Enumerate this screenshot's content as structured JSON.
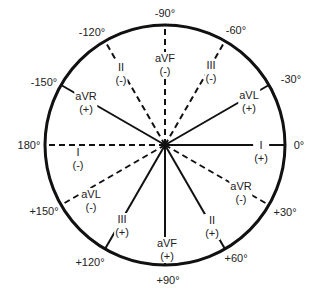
{
  "diagram": {
    "center": [
      165,
      145
    ],
    "radius": 120,
    "colors": {
      "line": "#111111",
      "background": "#ffffff"
    },
    "angle_labels": [
      {
        "text": "-90°",
        "x": 165,
        "y": 13
      },
      {
        "text": "-60°",
        "x": 236,
        "y": 30
      },
      {
        "text": "-30°",
        "x": 291,
        "y": 79
      },
      {
        "text": "0°",
        "x": 299,
        "y": 145
      },
      {
        "text": "+30°",
        "x": 285,
        "y": 212
      },
      {
        "text": "+60°",
        "x": 236,
        "y": 258
      },
      {
        "text": "+90°",
        "x": 168,
        "y": 280
      },
      {
        "text": "+120°",
        "x": 90,
        "y": 262
      },
      {
        "text": "+150°",
        "x": 44,
        "y": 211
      },
      {
        "text": "180°",
        "x": 29,
        "y": 145
      },
      {
        "text": "-150°",
        "x": 44,
        "y": 82
      },
      {
        "text": "-120°",
        "x": 92,
        "y": 32
      }
    ],
    "leads": [
      {
        "name": "aVF",
        "sign": "(-)",
        "angle": -90,
        "style": "dashed",
        "x": 165,
        "y": 65
      },
      {
        "name": "III",
        "sign": "(-)",
        "angle": -60,
        "style": "dashed",
        "x": 211,
        "y": 72
      },
      {
        "name": "aVL",
        "sign": "(+)",
        "angle": -30,
        "style": "solid",
        "x": 249,
        "y": 102
      },
      {
        "name": "I",
        "sign": "(+)",
        "angle": 0,
        "style": "solid",
        "x": 261,
        "y": 152
      },
      {
        "name": "aVR",
        "sign": "(-)",
        "angle": 30,
        "style": "dashed",
        "x": 241,
        "y": 193
      },
      {
        "name": "II",
        "sign": "(+)",
        "angle": 60,
        "style": "solid",
        "x": 212,
        "y": 227
      },
      {
        "name": "aVF",
        "sign": "(+)",
        "angle": 90,
        "style": "solid",
        "x": 167,
        "y": 250
      },
      {
        "name": "III",
        "sign": "(+)",
        "angle": 120,
        "style": "solid",
        "x": 122,
        "y": 226
      },
      {
        "name": "aVL",
        "sign": "(-)",
        "angle": 150,
        "style": "dashed",
        "x": 91,
        "y": 201
      },
      {
        "name": "I",
        "sign": "(-)",
        "angle": 180,
        "style": "dashed",
        "x": 78,
        "y": 159
      },
      {
        "name": "aVR",
        "sign": "(+)",
        "angle": -150,
        "style": "solid",
        "x": 86,
        "y": 103
      },
      {
        "name": "II",
        "sign": "(-)",
        "angle": -120,
        "style": "dashed",
        "x": 121,
        "y": 74
      }
    ]
  }
}
